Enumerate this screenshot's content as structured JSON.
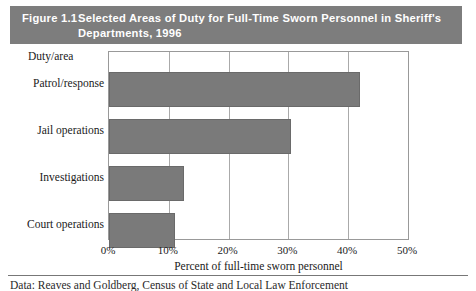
{
  "figure": {
    "label": "Figure 1.1",
    "title_line_1": "Selected Areas of Duty for Full-Time Sworn Personnel in Sheriff's",
    "title_line_2": "Departments, 1996",
    "banner_color": "#7d7d7d",
    "banner_text_color": "#ffffff"
  },
  "chart_data": {
    "type": "bar",
    "orientation": "horizontal",
    "title": "Selected Areas of Duty for Full-Time Sworn Personnel in Sheriff's Departments, 1996",
    "categories": [
      "Patrol/response",
      "Jail operations",
      "Investigations",
      "Court operations"
    ],
    "values": [
      42,
      30.5,
      12.5,
      11
    ],
    "xlabel": "Percent of full-time sworn personnel",
    "ylabel": "Duty/area",
    "xlim": [
      0,
      50
    ],
    "xticks": [
      0,
      10,
      20,
      30,
      40,
      50
    ],
    "xtick_labels": [
      "0%",
      "10%",
      "20%",
      "30%",
      "40%",
      "50%"
    ],
    "grid": "vertical",
    "legend": "none",
    "bar_color": "#7a7a7a"
  },
  "footer": {
    "source_note": "Data: Reaves and Goldberg, Census of State and Local Law Enforcement"
  }
}
